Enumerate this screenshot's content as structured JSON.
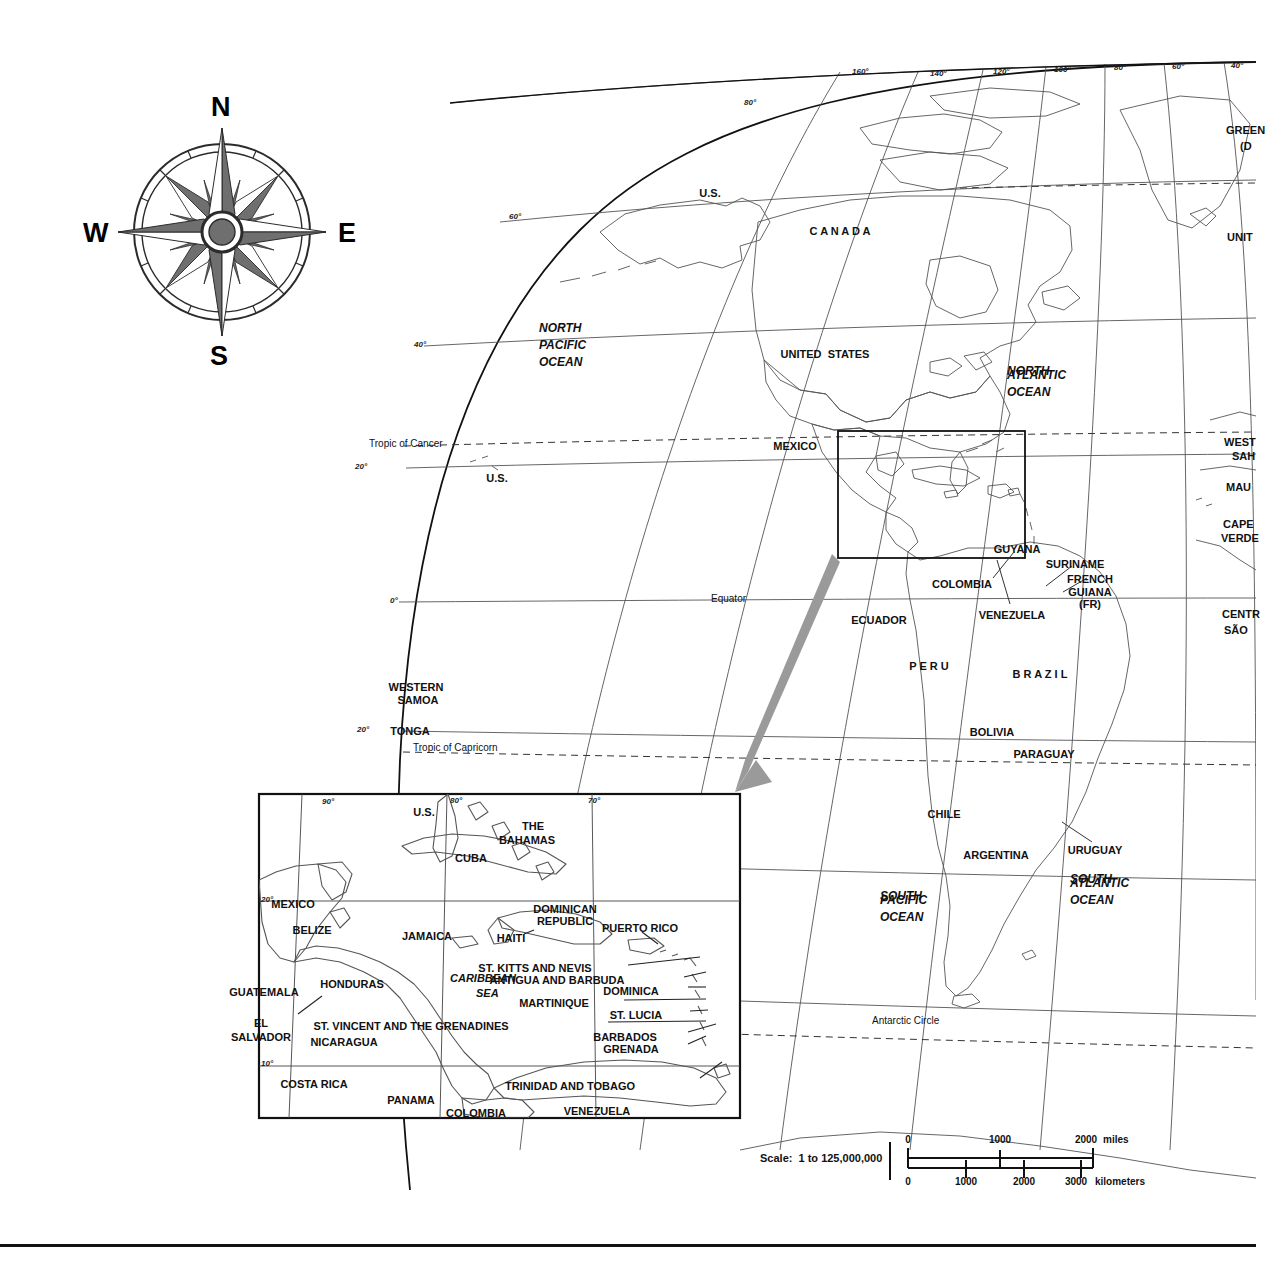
{
  "document": {
    "title": "World Map with Caribbean Inset",
    "scale_text": "Scale:  1 to 125,000,000"
  },
  "compass": {
    "name": "compass-rose",
    "north": "N",
    "east": "E",
    "south": "S",
    "west": "W"
  },
  "scalebar": {
    "miles_unit": "miles",
    "km_unit": "kilometers",
    "miles_ticks": [
      "0",
      "1000",
      "2000"
    ],
    "km_ticks": [
      "0",
      "1000",
      "2000",
      "3000"
    ]
  },
  "main_map": {
    "graticule_top_longitudes": [
      "160°",
      "140°",
      "120°",
      "100°",
      "80°",
      "60°",
      "40°"
    ],
    "graticule_left_latitudes": [
      "80°",
      "60°",
      "40°",
      "20°",
      "0°",
      "20°"
    ],
    "special_lines": [
      "Tropic of Cancer",
      "Equator",
      "Tropic of Capricorn",
      "Antarctic Circle"
    ],
    "oceans": [
      "NORTH\nPACIFIC\nOCEAN",
      "NORTH\nATLANTIC\nOCEAN",
      "SOUTH\nPACIFIC\nOCEAN",
      "SOUTH\nATLANTIC\nOCEAN"
    ],
    "ocean_labels": {
      "north_pacific": [
        "NORTH",
        "PACIFIC",
        "OCEAN"
      ],
      "north_atlantic": [
        "NORTH",
        "ATLANTIC",
        "OCEAN"
      ],
      "south_pacific": [
        "SOUTH",
        "PACIFIC",
        "OCEAN"
      ],
      "south_atlantic": [
        "SOUTH",
        "ATLANTIC",
        "OCEAN"
      ]
    },
    "countries": [
      {
        "name": "U.S.",
        "x": 710,
        "y": 187
      },
      {
        "name": "C A N A D A",
        "x": 840,
        "y": 225
      },
      {
        "name": "UNITED  STATES",
        "x": 825,
        "y": 348
      },
      {
        "name": "MEXICO",
        "x": 795,
        "y": 440
      },
      {
        "name": "COLOMBIA",
        "x": 962,
        "y": 578
      },
      {
        "name": "ECUADOR",
        "x": 879,
        "y": 614
      },
      {
        "name": "VENEZUELA",
        "x": 1012,
        "y": 609
      },
      {
        "name": "GUYANA",
        "x": 1017,
        "y": 543
      },
      {
        "name": "SURINAME",
        "x": 1075,
        "y": 558
      },
      {
        "name": "FRENCH",
        "x": 1090,
        "y": 573
      },
      {
        "name": "GUIANA",
        "x": 1090,
        "y": 586
      },
      {
        "name": "(FR)",
        "x": 1090,
        "y": 598
      },
      {
        "name": "P E R U",
        "x": 929,
        "y": 660
      },
      {
        "name": "B R A Z I L",
        "x": 1040,
        "y": 668
      },
      {
        "name": "BOLIVIA",
        "x": 992,
        "y": 726
      },
      {
        "name": "PARAGUAY",
        "x": 1044,
        "y": 748
      },
      {
        "name": "CHILE",
        "x": 944,
        "y": 808
      },
      {
        "name": "ARGENTINA",
        "x": 996,
        "y": 849
      },
      {
        "name": "URUGUAY",
        "x": 1095,
        "y": 844
      },
      {
        "name": "WESTERN",
        "x": 416,
        "y": 681
      },
      {
        "name": "SAMOA",
        "x": 418,
        "y": 694
      },
      {
        "name": "TONGA",
        "x": 410,
        "y": 725
      },
      {
        "name": "U.S.",
        "x": 497,
        "y": 472
      }
    ],
    "edge_clipped_labels": [
      {
        "name": "GREEN",
        "x": 1226,
        "y": 124
      },
      {
        "name": "(D",
        "x": 1240,
        "y": 140
      },
      {
        "name": "UNIT",
        "x": 1227,
        "y": 231
      },
      {
        "name": "WEST",
        "x": 1224,
        "y": 436
      },
      {
        "name": "SAH",
        "x": 1232,
        "y": 450
      },
      {
        "name": "MAU",
        "x": 1226,
        "y": 481
      },
      {
        "name": "CAPE",
        "x": 1223,
        "y": 518
      },
      {
        "name": "VERDE",
        "x": 1221,
        "y": 532
      },
      {
        "name": "CENTR",
        "x": 1222,
        "y": 608
      },
      {
        "name": "SÃO",
        "x": 1224,
        "y": 624
      }
    ]
  },
  "inset_map": {
    "title": "Caribbean detail",
    "graticule_longitudes": [
      "90°",
      "80°",
      "70°"
    ],
    "graticule_latitudes": [
      "20°",
      "10°"
    ],
    "sea_label": [
      "CARIBBEAN",
      "SEA"
    ],
    "labels": [
      {
        "name": "U.S.",
        "x": 424,
        "y": 806
      },
      {
        "name": "THE",
        "x": 533,
        "y": 820
      },
      {
        "name": "BAHAMAS",
        "x": 527,
        "y": 834
      },
      {
        "name": "CUBA",
        "x": 471,
        "y": 852
      },
      {
        "name": "MEXICO",
        "x": 293,
        "y": 898
      },
      {
        "name": "JAMAICA",
        "x": 427,
        "y": 930
      },
      {
        "name": "HAITI",
        "x": 511,
        "y": 932
      },
      {
        "name": "DOMINICAN",
        "x": 565,
        "y": 903
      },
      {
        "name": "REPUBLIC",
        "x": 565,
        "y": 915
      },
      {
        "name": "PUERTO RICO",
        "x": 640,
        "y": 922
      },
      {
        "name": "BELIZE",
        "x": 312,
        "y": 924
      },
      {
        "name": "GUATEMALA",
        "x": 264,
        "y": 986
      },
      {
        "name": "HONDURAS",
        "x": 352,
        "y": 978
      },
      {
        "name": "EL",
        "x": 261,
        "y": 1017
      },
      {
        "name": "SALVADOR",
        "x": 261,
        "y": 1031
      },
      {
        "name": "NICARAGUA",
        "x": 344,
        "y": 1036
      },
      {
        "name": "COSTA RICA",
        "x": 314,
        "y": 1078
      },
      {
        "name": "PANAMA",
        "x": 411,
        "y": 1094
      },
      {
        "name": "COLOMBIA",
        "x": 476,
        "y": 1107
      },
      {
        "name": "ST. KITTS AND NEVIS",
        "x": 535,
        "y": 962
      },
      {
        "name": "ANTIGUA AND BARBUDA",
        "x": 557,
        "y": 974
      },
      {
        "name": "DOMINICA",
        "x": 631,
        "y": 985
      },
      {
        "name": "MARTINIQUE",
        "x": 554,
        "y": 997
      },
      {
        "name": "ST. LUCIA",
        "x": 636,
        "y": 1009
      },
      {
        "name": "ST. VINCENT AND THE GRENADINES",
        "x": 411,
        "y": 1020
      },
      {
        "name": "BARBADOS",
        "x": 625,
        "y": 1031
      },
      {
        "name": "GRENADA",
        "x": 631,
        "y": 1043
      },
      {
        "name": "TRINIDAD AND TOBAGO",
        "x": 570,
        "y": 1080
      },
      {
        "name": "VENEZUELA",
        "x": 597,
        "y": 1105
      }
    ]
  },
  "colors": {
    "ink": "#111111",
    "coastline": "#4a4a4a",
    "graticule": "#555555",
    "arrow": "#9a9a9a",
    "paper": "#ffffff"
  }
}
